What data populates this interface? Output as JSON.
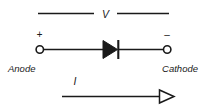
{
  "figure": {
    "background_color": "#ffffff",
    "ink_color": "#1a1a1a",
    "width": 206,
    "height": 108
  },
  "voltage": {
    "label": "V",
    "description": "voltage across the diode, indicated by a broken horizontal line spanning the two terminals"
  },
  "terminals": {
    "left": {
      "name": "Anode",
      "polarity_sign": "+",
      "marker": "open-circle"
    },
    "right": {
      "name": "Cathode",
      "polarity_sign": "–",
      "marker": "open-circle"
    }
  },
  "device": {
    "name": "diode",
    "symbol": "filled-triangle-with-bar",
    "direction": "right"
  },
  "current": {
    "label": "I",
    "arrow_direction": "right",
    "arrow_style": "hollow",
    "description": "conventional current flows from anode to cathode"
  }
}
